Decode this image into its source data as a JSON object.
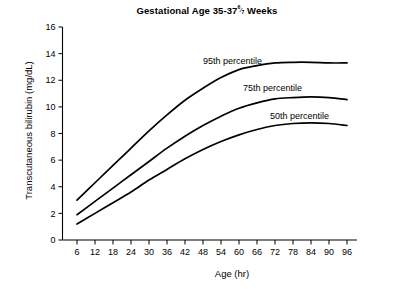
{
  "chart_data": {
    "type": "line",
    "title_main": "Gestational Age 35-37",
    "title_fraction_num": "6",
    "title_fraction_den": "7",
    "title_suffix": "Weeks",
    "xlabel": "Age (hr)",
    "ylabel": "Transcutaneous bilirubin (mg/dL)",
    "xlim": [
      0,
      99
    ],
    "ylim": [
      0,
      16
    ],
    "xticks": [
      6,
      12,
      18,
      24,
      30,
      36,
      42,
      48,
      54,
      60,
      66,
      72,
      78,
      84,
      90,
      96
    ],
    "yticks": [
      0,
      2,
      4,
      6,
      8,
      10,
      12,
      14,
      16
    ],
    "grid": false,
    "legend_position": "inline-annotations",
    "line_color": "#000000",
    "x": [
      6,
      12,
      18,
      24,
      30,
      36,
      42,
      48,
      54,
      60,
      66,
      72,
      78,
      84,
      90,
      96
    ],
    "series": [
      {
        "name": "95th percentile",
        "label": "95th percentile",
        "values": [
          3.0,
          4.3,
          5.6,
          6.9,
          8.2,
          9.4,
          10.5,
          11.4,
          12.2,
          12.8,
          13.1,
          13.3,
          13.35,
          13.35,
          13.3,
          13.3
        ]
      },
      {
        "name": "75th percentile",
        "label": "75th percentile",
        "values": [
          1.9,
          2.9,
          3.9,
          4.9,
          5.9,
          6.9,
          7.8,
          8.6,
          9.3,
          9.9,
          10.3,
          10.6,
          10.7,
          10.75,
          10.7,
          10.55
        ]
      },
      {
        "name": "50th percentile",
        "label": "50th percentile",
        "values": [
          1.2,
          2.0,
          2.8,
          3.6,
          4.5,
          5.3,
          6.1,
          6.8,
          7.4,
          7.9,
          8.3,
          8.6,
          8.75,
          8.8,
          8.75,
          8.6
        ]
      }
    ],
    "annotations": [
      {
        "text": "95th percentile",
        "x_px": 203,
        "y_px": 64
      },
      {
        "text": "75th percentile",
        "x_px": 243,
        "y_px": 91
      },
      {
        "text": "50th percentile",
        "x_px": 270,
        "y_px": 119
      }
    ]
  }
}
